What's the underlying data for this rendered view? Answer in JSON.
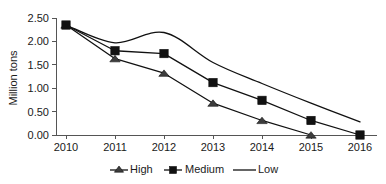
{
  "chart_data": {
    "type": "line",
    "title": "",
    "xlabel": "",
    "ylabel": "Million tons",
    "categories": [
      "2010",
      "2011",
      "2012",
      "2013",
      "2014",
      "2015",
      "2016"
    ],
    "x": [
      2010,
      2011,
      2012,
      2013,
      2014,
      2015,
      2016
    ],
    "ylim": [
      0.0,
      2.5
    ],
    "xlim": [
      2010,
      2016
    ],
    "yticks": [
      0.0,
      0.5,
      1.0,
      1.5,
      2.0,
      2.5
    ],
    "ytick_labels": [
      "0.00",
      "0.50",
      "1.00",
      "1.50",
      "2.00",
      "2.50"
    ],
    "xtick_labels": [
      "2010",
      "2011",
      "2012",
      "2013",
      "2014",
      "2015",
      "2016"
    ],
    "grid": false,
    "legend_position": "bottom",
    "series": [
      {
        "name": "High",
        "marker": "triangle",
        "color": "#111111",
        "values": [
          2.35,
          1.63,
          1.32,
          0.68,
          0.31,
          0.0,
          null
        ]
      },
      {
        "name": "Medium",
        "marker": "square",
        "color": "#111111",
        "values": [
          2.35,
          1.8,
          1.74,
          1.12,
          0.74,
          0.31,
          0.0
        ]
      },
      {
        "name": "Low",
        "marker": "none",
        "color": "#111111",
        "smooth": true,
        "values": [
          2.35,
          1.97,
          2.19,
          1.55,
          1.1,
          0.68,
          0.28
        ]
      }
    ]
  },
  "axes": {
    "y_title": "Million tons",
    "y_ticks": [
      {
        "label": "2.50"
      },
      {
        "label": "2.00"
      },
      {
        "label": "1.50"
      },
      {
        "label": "1.00"
      },
      {
        "label": "0.50"
      },
      {
        "label": "0.00"
      }
    ],
    "x_ticks": [
      {
        "label": "2010"
      },
      {
        "label": "2011"
      },
      {
        "label": "2012"
      },
      {
        "label": "2013"
      },
      {
        "label": "2014"
      },
      {
        "label": "2015"
      },
      {
        "label": "2016"
      }
    ]
  },
  "legend": {
    "items": [
      {
        "label": "High",
        "marker": "triangle"
      },
      {
        "label": "Medium",
        "marker": "square"
      },
      {
        "label": "Low",
        "marker": "none"
      }
    ]
  },
  "colors": {
    "series_stroke": "#111111",
    "axis": "#555555",
    "text": "#1a1a1a",
    "background": "#ffffff"
  }
}
